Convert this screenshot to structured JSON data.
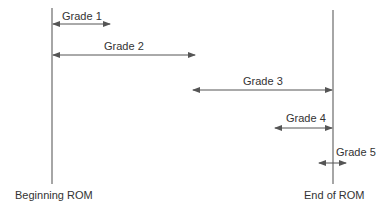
{
  "diagram": {
    "type": "range-of-motion grading",
    "colors": {
      "line": "#6b6b6b",
      "arrow": "#555555",
      "text": "#333333"
    },
    "axes": {
      "start_label": "Beginning ROM",
      "end_label": "End of ROM"
    },
    "grades": [
      {
        "label": "Grade 1",
        "from": "beginning",
        "extent": "small amplitude at beginning of range"
      },
      {
        "label": "Grade 2",
        "from": "beginning",
        "extent": "large amplitude within range"
      },
      {
        "label": "Grade 3",
        "from": "mid-range",
        "to": "end of range",
        "extent": "large amplitude to end of range"
      },
      {
        "label": "Grade 4",
        "to": "end of range",
        "extent": "small amplitude at end of range"
      },
      {
        "label": "Grade 5",
        "at": "end of range",
        "extent": "small thrust beyond end of range"
      }
    ]
  }
}
